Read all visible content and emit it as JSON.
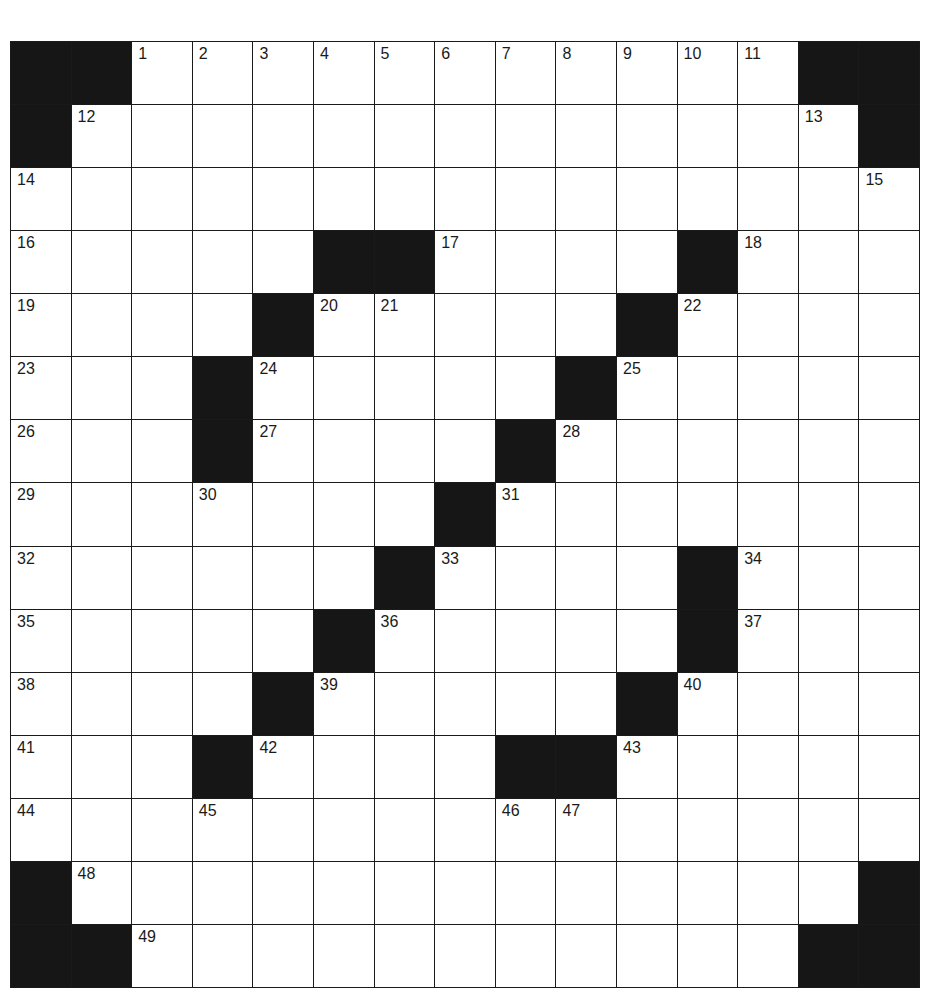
{
  "puzzle": {
    "rows": 15,
    "cols": 15,
    "colors": {
      "block": "#161616",
      "cell": "#ffffff",
      "line": "#1a1a1a"
    },
    "blocks": [
      [
        0,
        0
      ],
      [
        0,
        1
      ],
      [
        0,
        13
      ],
      [
        0,
        14
      ],
      [
        1,
        0
      ],
      [
        1,
        14
      ],
      [
        3,
        5
      ],
      [
        3,
        6
      ],
      [
        3,
        11
      ],
      [
        4,
        4
      ],
      [
        4,
        10
      ],
      [
        5,
        3
      ],
      [
        5,
        9
      ],
      [
        6,
        3
      ],
      [
        6,
        8
      ],
      [
        7,
        7
      ],
      [
        8,
        6
      ],
      [
        8,
        11
      ],
      [
        9,
        5
      ],
      [
        9,
        11
      ],
      [
        10,
        4
      ],
      [
        10,
        10
      ],
      [
        11,
        3
      ],
      [
        11,
        8
      ],
      [
        11,
        9
      ],
      [
        13,
        0
      ],
      [
        13,
        14
      ],
      [
        14,
        0
      ],
      [
        14,
        1
      ],
      [
        14,
        13
      ],
      [
        14,
        14
      ]
    ],
    "numbers": [
      {
        "r": 0,
        "c": 2,
        "n": "1"
      },
      {
        "r": 0,
        "c": 3,
        "n": "2"
      },
      {
        "r": 0,
        "c": 4,
        "n": "3"
      },
      {
        "r": 0,
        "c": 5,
        "n": "4"
      },
      {
        "r": 0,
        "c": 6,
        "n": "5"
      },
      {
        "r": 0,
        "c": 7,
        "n": "6"
      },
      {
        "r": 0,
        "c": 8,
        "n": "7"
      },
      {
        "r": 0,
        "c": 9,
        "n": "8"
      },
      {
        "r": 0,
        "c": 10,
        "n": "9"
      },
      {
        "r": 0,
        "c": 11,
        "n": "10"
      },
      {
        "r": 0,
        "c": 12,
        "n": "11"
      },
      {
        "r": 1,
        "c": 1,
        "n": "12"
      },
      {
        "r": 1,
        "c": 13,
        "n": "13"
      },
      {
        "r": 2,
        "c": 0,
        "n": "14"
      },
      {
        "r": 2,
        "c": 14,
        "n": "15"
      },
      {
        "r": 3,
        "c": 0,
        "n": "16"
      },
      {
        "r": 3,
        "c": 7,
        "n": "17"
      },
      {
        "r": 3,
        "c": 12,
        "n": "18"
      },
      {
        "r": 4,
        "c": 0,
        "n": "19"
      },
      {
        "r": 4,
        "c": 5,
        "n": "20"
      },
      {
        "r": 4,
        "c": 6,
        "n": "21"
      },
      {
        "r": 4,
        "c": 11,
        "n": "22"
      },
      {
        "r": 5,
        "c": 0,
        "n": "23"
      },
      {
        "r": 5,
        "c": 4,
        "n": "24"
      },
      {
        "r": 5,
        "c": 10,
        "n": "25"
      },
      {
        "r": 6,
        "c": 0,
        "n": "26"
      },
      {
        "r": 6,
        "c": 4,
        "n": "27"
      },
      {
        "r": 6,
        "c": 9,
        "n": "28"
      },
      {
        "r": 7,
        "c": 0,
        "n": "29"
      },
      {
        "r": 7,
        "c": 3,
        "n": "30"
      },
      {
        "r": 7,
        "c": 8,
        "n": "31"
      },
      {
        "r": 8,
        "c": 0,
        "n": "32"
      },
      {
        "r": 8,
        "c": 7,
        "n": "33"
      },
      {
        "r": 8,
        "c": 12,
        "n": "34"
      },
      {
        "r": 9,
        "c": 0,
        "n": "35"
      },
      {
        "r": 9,
        "c": 6,
        "n": "36"
      },
      {
        "r": 9,
        "c": 12,
        "n": "37"
      },
      {
        "r": 10,
        "c": 0,
        "n": "38"
      },
      {
        "r": 10,
        "c": 5,
        "n": "39"
      },
      {
        "r": 10,
        "c": 11,
        "n": "40"
      },
      {
        "r": 11,
        "c": 0,
        "n": "41"
      },
      {
        "r": 11,
        "c": 4,
        "n": "42"
      },
      {
        "r": 11,
        "c": 10,
        "n": "43"
      },
      {
        "r": 12,
        "c": 0,
        "n": "44"
      },
      {
        "r": 12,
        "c": 3,
        "n": "45"
      },
      {
        "r": 12,
        "c": 8,
        "n": "46"
      },
      {
        "r": 12,
        "c": 9,
        "n": "47"
      },
      {
        "r": 13,
        "c": 1,
        "n": "48"
      },
      {
        "r": 14,
        "c": 2,
        "n": "49"
      }
    ],
    "entries": []
  }
}
